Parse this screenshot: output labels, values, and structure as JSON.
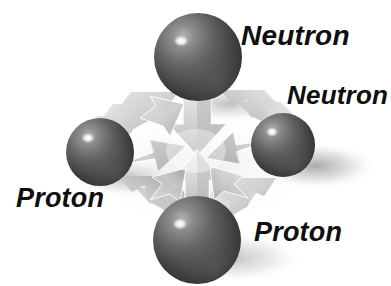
{
  "figure": {
    "background_color": "#ffffff",
    "width": 391,
    "height": 286,
    "labels": [
      {
        "id": "neutron-top",
        "text": "Neutron",
        "particle": "neutron",
        "x": 241,
        "y": 22
      },
      {
        "id": "neutron-right",
        "text": "Neutron",
        "particle": "neutron",
        "x": 287,
        "y": 82
      },
      {
        "id": "proton-left",
        "text": "Proton",
        "particle": "proton",
        "x": 16,
        "y": 185
      },
      {
        "id": "proton-bottom",
        "text": "Proton",
        "particle": "proton",
        "x": 254,
        "y": 219
      }
    ],
    "nucleons": [
      {
        "id": "nucleon-top",
        "particle": "neutron",
        "cx": 198,
        "cy": 57,
        "r": 44,
        "highlight": "#ffffff",
        "body_color": "#6a6a6a",
        "shade_color": "#232323"
      },
      {
        "id": "nucleon-right",
        "particle": "neutron",
        "cx": 283,
        "cy": 145,
        "r": 32,
        "highlight": "#ffffff",
        "body_color": "#6a6a6a",
        "shade_color": "#232323"
      },
      {
        "id": "nucleon-left",
        "particle": "proton",
        "cx": 100,
        "cy": 152,
        "r": 34,
        "highlight": "#ffffff",
        "body_color": "#6a6a6a",
        "shade_color": "#232323"
      },
      {
        "id": "nucleon-bottom",
        "particle": "proton",
        "cx": 197,
        "cy": 240,
        "r": 44,
        "highlight": "#ffffff",
        "body_color": "#6a6a6a",
        "shade_color": "#232323"
      }
    ],
    "force_center": {
      "x": 196,
      "y": 151
    },
    "arrow_color": "#c9c9c9",
    "arrow_shade_color": "#a8a8a8",
    "arrow_meaning": "strong nuclear force pulling nucleons together",
    "shadow_color": "#bdbdbd"
  }
}
